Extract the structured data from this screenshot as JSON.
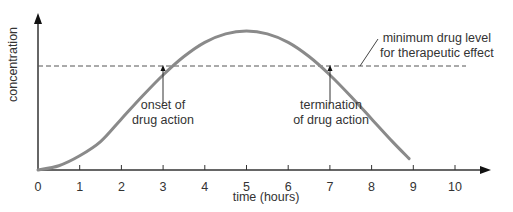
{
  "chart_data": {
    "type": "line",
    "title": "",
    "xlabel": "time (hours)",
    "ylabel": "concentration",
    "xlim": [
      0,
      10.8
    ],
    "ylim": [
      0,
      1
    ],
    "x_ticks": [
      "0",
      "1",
      "2",
      "3",
      "4",
      "5",
      "6",
      "7",
      "8",
      "9",
      "10"
    ],
    "grid": false,
    "legend": null,
    "series": [
      {
        "name": "drug concentration",
        "x": [
          0,
          0.5,
          1,
          1.5,
          2,
          2.5,
          3,
          3.5,
          4,
          4.5,
          5,
          5.5,
          6,
          6.5,
          7,
          7.5,
          8,
          8.5,
          8.9
        ],
        "y": [
          0,
          0.03,
          0.1,
          0.2,
          0.36,
          0.52,
          0.67,
          0.8,
          0.9,
          0.96,
          0.98,
          0.96,
          0.9,
          0.8,
          0.67,
          0.52,
          0.36,
          0.2,
          0.08
        ],
        "color": "#8a8a8a"
      }
    ],
    "threshold": {
      "label": "minimum drug level for therapeutic effect",
      "y": 0.67,
      "style": "dashed"
    },
    "annotations": [
      {
        "text": "onset of drug action",
        "x": 3,
        "y": 0.67
      },
      {
        "text": "termination of drug action",
        "x": 7,
        "y": 0.67
      },
      {
        "text": "minimum drug level for therapeutic effect",
        "x": 7.6,
        "y": 0.67
      }
    ]
  },
  "labels": {
    "xlabel": "time (hours)",
    "ylabel": "concentration",
    "onset_line1": "onset of",
    "onset_line2": "drug action",
    "term_line1": "termination",
    "term_line2": "of drug action",
    "min_line1": "minimum drug level",
    "min_line2": "for therapeutic effect",
    "ticks": [
      "0",
      "1",
      "2",
      "3",
      "4",
      "5",
      "6",
      "7",
      "8",
      "9",
      "10"
    ]
  }
}
